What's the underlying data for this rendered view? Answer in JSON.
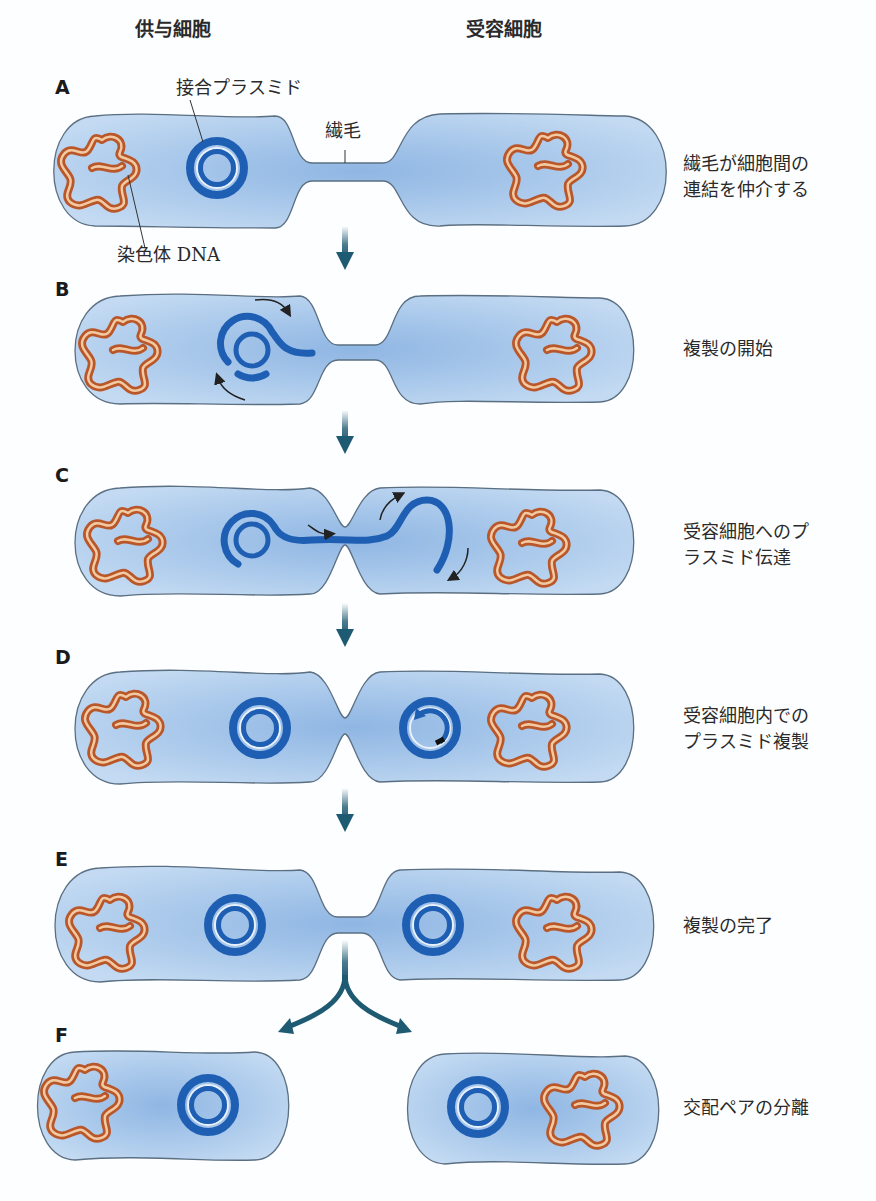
{
  "headers": {
    "donor": "供与細胞",
    "recipient": "受容細胞"
  },
  "annotations": {
    "plasmid": "接合プラスミド",
    "pilus": "繊毛",
    "chromosome": "染色体 DNA"
  },
  "steps": [
    {
      "letter": "A",
      "caption_line1": "繊毛が細胞間の",
      "caption_line2": "連結を仲介する"
    },
    {
      "letter": "B",
      "caption_line1": "複製の開始",
      "caption_line2": ""
    },
    {
      "letter": "C",
      "caption_line1": "受容細胞へのプ",
      "caption_line2": "ラスミド伝達"
    },
    {
      "letter": "D",
      "caption_line1": "受容細胞内での",
      "caption_line2": "プラスミド複製"
    },
    {
      "letter": "E",
      "caption_line1": "複製の完了",
      "caption_line2": ""
    },
    {
      "letter": "F",
      "caption_line1": "交配ペアの分離",
      "caption_line2": ""
    }
  ],
  "colors": {
    "cell_fill": "#b9d3ee",
    "cell_core": "#8fb6e3",
    "cell_outline": "#5b6f82",
    "plasmid": "#1f5fb3",
    "chromosome": "#c86a3a",
    "chromosome_inner": "#f0c39a",
    "arrow": "#1f5a73"
  }
}
